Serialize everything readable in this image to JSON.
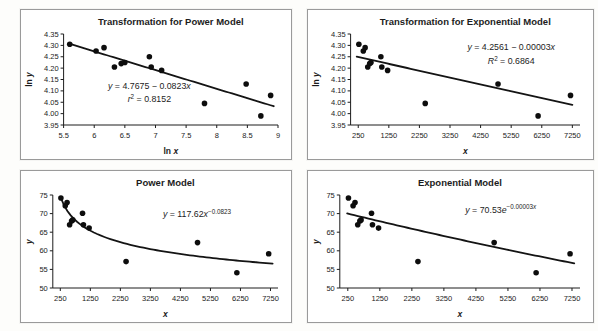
{
  "page": {
    "background": "#fdfdfb"
  },
  "colors": {
    "ink": "#1c1c1c",
    "axis": "#1c1c1c",
    "point": "#0d0d0d",
    "trend": "#141414",
    "panel_border": "#9a9a9a",
    "panel_bg": "#ffffff"
  },
  "chart_data": [
    {
      "id": "transformation-power",
      "type": "scatter",
      "title": "Transformation for Power Model",
      "xlabel": [
        {
          "t": "ln "
        },
        {
          "t": "x",
          "i": 1
        }
      ],
      "ylabel": [
        {
          "t": "ln "
        },
        {
          "t": "y",
          "i": 1
        }
      ],
      "xlim": [
        5.5,
        9
      ],
      "ylim": [
        3.95,
        4.35
      ],
      "x_ticks": [
        "5.5",
        "6",
        "6.5",
        "7",
        "7.5",
        "8",
        "8.5",
        "9"
      ],
      "y_ticks": [
        "3.95",
        "4.00",
        "4.05",
        "4.10",
        "4.15",
        "4.20",
        "4.25",
        "4.30",
        "4.35"
      ],
      "grid": false,
      "legend": false,
      "points": [
        [
          5.6,
          4.305
        ],
        [
          6.03,
          4.275
        ],
        [
          6.16,
          4.29
        ],
        [
          6.33,
          4.205
        ],
        [
          6.44,
          4.22
        ],
        [
          6.5,
          4.225
        ],
        [
          6.9,
          4.25
        ],
        [
          6.93,
          4.205
        ],
        [
          7.1,
          4.19
        ],
        [
          7.8,
          4.045
        ],
        [
          8.48,
          4.13
        ],
        [
          8.72,
          3.99
        ],
        [
          8.88,
          4.08
        ]
      ],
      "fit": {
        "kind": "linear",
        "a": 4.7675,
        "b": -0.0823,
        "x_from": 5.58,
        "x_to": 8.93
      },
      "equation": {
        "pos": {
          "x": 0.4,
          "y": 0.6,
          "gap": 0.145
        },
        "lines": [
          [
            {
              "t": "y",
              "i": 1
            },
            {
              "t": " = 4.7675 − 0.0823"
            },
            {
              "t": "x",
              "i": 1
            }
          ],
          [
            {
              "t": "r",
              "i": 1
            },
            {
              "t": "2",
              "sup": 1
            },
            {
              "t": " = 0.8152"
            }
          ]
        ]
      }
    },
    {
      "id": "transformation-exponential",
      "type": "scatter",
      "title": "Transformation for Exponential Model",
      "xlabel": [
        {
          "t": "x",
          "i": 1
        }
      ],
      "ylabel": [
        {
          "t": "ln "
        },
        {
          "t": "y",
          "i": 1
        }
      ],
      "xlim": [
        0,
        7500
      ],
      "ylim": [
        3.95,
        4.35
      ],
      "x_ticks": [
        "250",
        "1250",
        "2250",
        "3250",
        "4250",
        "5250",
        "6250",
        "7250"
      ],
      "y_ticks": [
        "3.95",
        "4.00",
        "4.05",
        "4.10",
        "4.15",
        "4.20",
        "4.25",
        "4.30",
        "4.35"
      ],
      "grid": false,
      "legend": false,
      "points": [
        [
          270,
          4.305
        ],
        [
          415,
          4.275
        ],
        [
          475,
          4.29
        ],
        [
          560,
          4.205
        ],
        [
          625,
          4.22
        ],
        [
          665,
          4.225
        ],
        [
          990,
          4.25
        ],
        [
          1020,
          4.205
        ],
        [
          1210,
          4.19
        ],
        [
          2440,
          4.045
        ],
        [
          4820,
          4.13
        ],
        [
          6130,
          3.99
        ],
        [
          7190,
          4.08
        ]
      ],
      "fit": {
        "kind": "linear",
        "a": 4.2561,
        "b": -3e-05,
        "x_from": 200,
        "x_to": 7250
      },
      "equation": {
        "pos": {
          "x": 0.7,
          "y": 0.18,
          "gap": 0.155
        },
        "lines": [
          [
            {
              "t": "y",
              "i": 1
            },
            {
              "t": " = 4.2561 − 0.00003"
            },
            {
              "t": "x",
              "i": 1
            }
          ],
          [
            {
              "t": "R",
              "i": 1
            },
            {
              "t": "2",
              "sup": 1
            },
            {
              "t": " = 0.6864"
            }
          ]
        ]
      }
    },
    {
      "id": "power-model",
      "type": "scatter",
      "title": "Power Model",
      "xlabel": [
        {
          "t": "x",
          "i": 1
        }
      ],
      "ylabel": [
        {
          "t": "y",
          "i": 1
        }
      ],
      "xlim": [
        0,
        7500
      ],
      "ylim": [
        50,
        75
      ],
      "x_ticks": [
        "250",
        "1250",
        "2250",
        "3250",
        "4250",
        "5250",
        "6250",
        "7250"
      ],
      "y_ticks": [
        "50",
        "55",
        "60",
        "65",
        "70",
        "75"
      ],
      "grid": false,
      "legend": false,
      "points": [
        [
          270,
          74.2
        ],
        [
          415,
          72.1
        ],
        [
          475,
          73.0
        ],
        [
          560,
          67.0
        ],
        [
          625,
          68.0
        ],
        [
          665,
          68.3
        ],
        [
          990,
          70.1
        ],
        [
          1020,
          67.0
        ],
        [
          1210,
          66.1
        ],
        [
          2440,
          57.1
        ],
        [
          4820,
          62.2
        ],
        [
          6130,
          54.1
        ],
        [
          7190,
          59.2
        ]
      ],
      "fit": {
        "kind": "power",
        "a": 117.62,
        "b": -0.0823,
        "x_from": 265,
        "x_to": 7320
      },
      "equation": {
        "pos": {
          "x": 0.64,
          "y": 0.24,
          "gap": 0.15
        },
        "lines": [
          [
            {
              "t": "y",
              "i": 1
            },
            {
              "t": " = 117.62"
            },
            {
              "t": "x",
              "i": 1
            },
            {
              "t": "−0.0823",
              "sup": 1
            }
          ]
        ]
      }
    },
    {
      "id": "exponential-model",
      "type": "scatter",
      "title": "Exponential Model",
      "xlabel": [
        {
          "t": "x",
          "i": 1
        }
      ],
      "ylabel": [
        {
          "t": "y",
          "i": 1
        }
      ],
      "xlim": [
        0,
        7500
      ],
      "ylim": [
        50,
        75
      ],
      "x_ticks": [
        "250",
        "1250",
        "2250",
        "3250",
        "4250",
        "5250",
        "6250",
        "7250"
      ],
      "y_ticks": [
        "50",
        "55",
        "60",
        "65",
        "70",
        "75"
      ],
      "grid": false,
      "legend": false,
      "points": [
        [
          270,
          74.2
        ],
        [
          415,
          72.1
        ],
        [
          475,
          73.0
        ],
        [
          560,
          67.0
        ],
        [
          625,
          68.0
        ],
        [
          665,
          68.3
        ],
        [
          990,
          70.1
        ],
        [
          1020,
          67.0
        ],
        [
          1210,
          66.1
        ],
        [
          2440,
          57.1
        ],
        [
          4820,
          62.2
        ],
        [
          6130,
          54.1
        ],
        [
          7190,
          59.2
        ]
      ],
      "fit": {
        "kind": "exp",
        "a": 70.53,
        "b": -3e-05,
        "x_from": 230,
        "x_to": 7320
      },
      "equation": {
        "pos": {
          "x": 0.67,
          "y": 0.19,
          "gap": 0.15
        },
        "lines": [
          [
            {
              "t": "y",
              "i": 1
            },
            {
              "t": " = 70.53"
            },
            {
              "t": "e",
              "i": 1
            },
            {
              "t": "−0.00003",
              "sup": 1
            },
            {
              "t": "x",
              "sup": 1,
              "i": 1
            }
          ]
        ]
      }
    }
  ]
}
